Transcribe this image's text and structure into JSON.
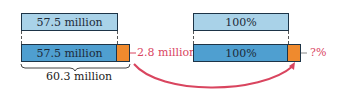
{
  "left": {
    "top_bar_label": "57.5 million",
    "bottom_bar_label": "57.5 million",
    "extra_label": "2.8 million",
    "total_label": "60.3 million"
  },
  "right": {
    "top_bar_label": "100%",
    "bottom_bar_label": "100%",
    "extra_label": "?%"
  },
  "colors": {
    "light_bar": "#a9d2e8",
    "dark_bar": "#4f9fd0",
    "extra_segment": "#ef8a2e",
    "annotation": "#d9455f"
  }
}
